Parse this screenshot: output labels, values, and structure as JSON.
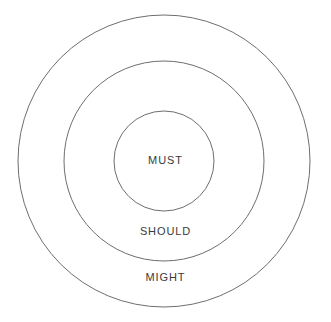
{
  "diagram": {
    "type": "concentric-circles",
    "background_color": "#ffffff",
    "stroke_color": "#6e6e6e",
    "stroke_width": 1,
    "fill": "none",
    "text_color": "#3a3a3a",
    "center": {
      "x": 164,
      "y": 161
    },
    "rings": [
      {
        "id": "outer",
        "label": "MIGHT",
        "radius": 146,
        "label_position": {
          "x": 164,
          "y": 277
        }
      },
      {
        "id": "middle",
        "label": "SHOULD",
        "radius": 100,
        "label_position": {
          "x": 164,
          "y": 231
        }
      },
      {
        "id": "inner",
        "label": "MUST",
        "radius": 50,
        "label_position": {
          "x": 164,
          "y": 160
        }
      }
    ]
  }
}
